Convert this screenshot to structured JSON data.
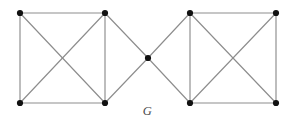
{
  "figure": {
    "label": "G",
    "caption_label": "G",
    "width": 295,
    "height": 125,
    "background_color": "#ffffff",
    "edge_color": "#8d8d8d",
    "vertex_color": "#111111",
    "label_color": "#4a4a4a",
    "vertex_radius": 3.1,
    "edge_width": 1.15
  },
  "chart_data": {
    "type": "diagram",
    "diagram_kind": "graph",
    "title": "G",
    "node_count": 9,
    "edge_count": 14,
    "nodes": [
      {
        "id": "a",
        "label": "",
        "x": 20,
        "y": 13
      },
      {
        "id": "b",
        "label": "",
        "x": 105,
        "y": 13
      },
      {
        "id": "c",
        "label": "",
        "x": 20,
        "y": 103
      },
      {
        "id": "d",
        "label": "",
        "x": 105,
        "y": 103
      },
      {
        "id": "e",
        "label": "",
        "x": 148,
        "y": 58
      },
      {
        "id": "f",
        "label": "",
        "x": 190,
        "y": 13
      },
      {
        "id": "g",
        "label": "",
        "x": 276,
        "y": 13
      },
      {
        "id": "h",
        "label": "",
        "x": 190,
        "y": 103
      },
      {
        "id": "i",
        "label": "",
        "x": 276,
        "y": 103
      }
    ],
    "edges": [
      {
        "source": "a",
        "target": "b",
        "kind": "top-side-left"
      },
      {
        "source": "a",
        "target": "c",
        "kind": "left-side-left"
      },
      {
        "source": "b",
        "target": "d",
        "kind": "right-side-left"
      },
      {
        "source": "c",
        "target": "d",
        "kind": "bottom-side-left"
      },
      {
        "source": "a",
        "target": "d",
        "kind": "diagonal-left"
      },
      {
        "source": "b",
        "target": "c",
        "kind": "diagonal-left"
      },
      {
        "source": "b",
        "target": "e",
        "kind": "center-link"
      },
      {
        "source": "d",
        "target": "e",
        "kind": "center-link"
      },
      {
        "source": "e",
        "target": "f",
        "kind": "center-link"
      },
      {
        "source": "e",
        "target": "h",
        "kind": "center-link"
      },
      {
        "source": "f",
        "target": "g",
        "kind": "top-side-right"
      },
      {
        "source": "f",
        "target": "h",
        "kind": "left-side-right"
      },
      {
        "source": "g",
        "target": "i",
        "kind": "right-side-right"
      },
      {
        "source": "h",
        "target": "i",
        "kind": "bottom-side-right"
      },
      {
        "source": "f",
        "target": "i",
        "kind": "diagonal-right"
      },
      {
        "source": "g",
        "target": "h",
        "kind": "diagonal-right"
      }
    ],
    "xlim": [
      0,
      295
    ],
    "ylim": [
      0,
      125
    ],
    "grid": false,
    "legend": null
  }
}
